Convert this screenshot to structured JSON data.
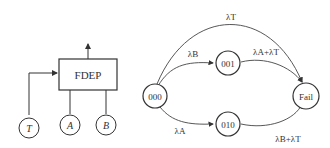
{
  "fault_tree": {
    "gate_label": "FDEP",
    "trigger_event": "T",
    "dependent_events": [
      "A",
      "B"
    ]
  },
  "markov_chain": {
    "states": {
      "initial": "000",
      "upper": "001",
      "lower": "010",
      "fail": "Fail"
    },
    "transitions": {
      "top": "λT",
      "to_001": "λB",
      "from_001": "λA+λT",
      "to_010": "λA",
      "from_010": "λB+λT"
    }
  }
}
